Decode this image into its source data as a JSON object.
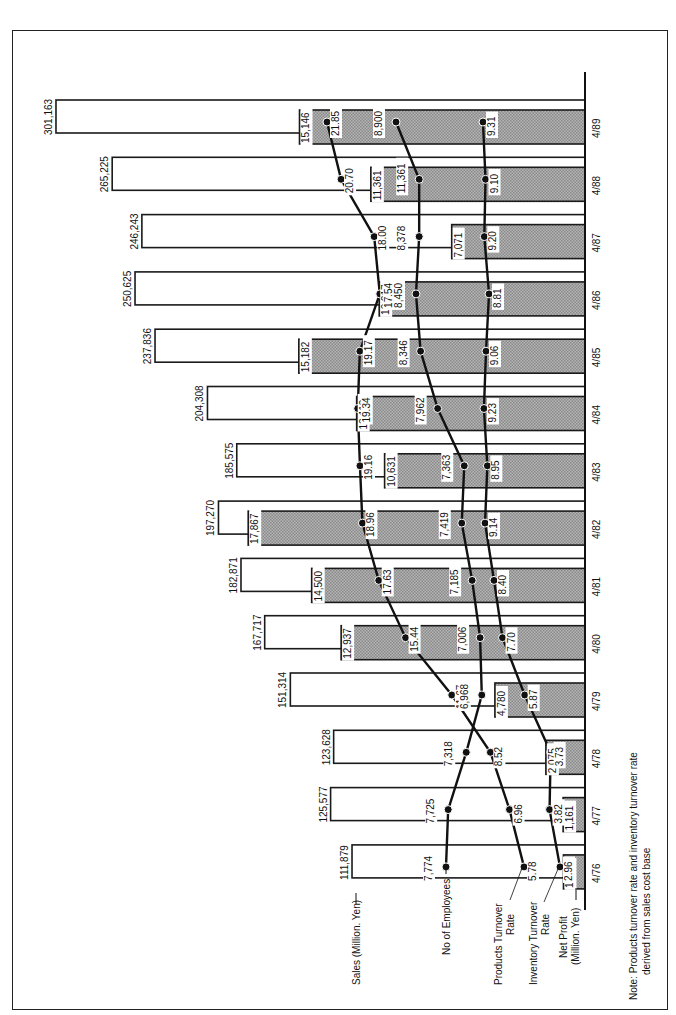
{
  "chart_data": {
    "type": "bar+line",
    "orientation": "rotated (categories top-to-bottom, values extend leftward)",
    "title": "",
    "categories": [
      "4/89",
      "4/88",
      "4/87",
      "4/86",
      "4/85",
      "4/84",
      "4/83",
      "4/82",
      "4/81",
      "4/80",
      "4/79",
      "4/78",
      "4/77",
      "4/76"
    ],
    "series": [
      {
        "name": "Sales (Million. Yen)",
        "kind": "bar-outline",
        "values": [
          301163,
          265225,
          246243,
          250625,
          237836,
          204308,
          185575,
          197270,
          182871,
          167717,
          151314,
          123628,
          125577,
          111879
        ]
      },
      {
        "name": "Net Profit (Million. Yen)",
        "kind": "bar-shaded",
        "values": [
          15146,
          11361,
          7071,
          10917,
          15182,
          12113,
          10631,
          17867,
          14500,
          12937,
          4780,
          2075,
          1161,
          1142
        ]
      },
      {
        "name": "No of Employees",
        "kind": "line",
        "values": [
          8900,
          8378,
          8378,
          8450,
          8346,
          7962,
          7363,
          7419,
          7185,
          7006,
          6968,
          7318,
          7725,
          7774
        ]
      },
      {
        "name": "Products Turnover Rate",
        "kind": "line",
        "values": [
          21.85,
          20.7,
          18.0,
          17.54,
          19.17,
          19.34,
          19.16,
          18.96,
          17.63,
          15.44,
          11.67,
          8.52,
          6.96,
          5.78
        ]
      },
      {
        "name": "Inventory Turnover Rate",
        "kind": "line",
        "values": [
          9.31,
          9.1,
          9.2,
          8.81,
          9.06,
          9.23,
          8.95,
          9.14,
          8.4,
          7.7,
          5.87,
          3.73,
          3.82,
          2.96
        ]
      }
    ],
    "labels": {
      "employees_4_88": "11,361",
      "note": "Note: Products turnover rate and inventory turnover rate derived from sales cost base"
    },
    "colors": {
      "outline": "#1a1a1a",
      "profit_fill": "#9a9a9a",
      "background": "#ffffff"
    }
  },
  "legend": {
    "sales": "Sales (Million. Yen)",
    "employees": "No of Employees",
    "products_1": "Products Turnover",
    "products_2": "Rate",
    "inventory_1": "Inventory Turnover",
    "inventory_2": "Rate",
    "profit_1": "Net Profit",
    "profit_2": "(Million. Yen)"
  },
  "note": {
    "line1": "Note: Products turnover rate and inventory turnover rate",
    "line2": "derived from sales cost base"
  },
  "value_labels": {
    "sales": [
      "301,163",
      "265,225",
      "246,243",
      "250,625",
      "237,836",
      "204,308",
      "185,575",
      "197,270",
      "182,871",
      "167,717",
      "151,314",
      "123,628",
      "125,577",
      "111,879"
    ],
    "profit": [
      "15,146",
      "11,361",
      "7,071",
      "10,917",
      "15,182",
      "12,113",
      "10,631",
      "17,867",
      "14,500",
      "12,937",
      "4,780",
      "2,075",
      "1,161",
      "1,142"
    ],
    "employees": [
      "8,900",
      "11,361",
      "8,378",
      "8,450",
      "8,346",
      "7,962",
      "7,363",
      "7,419",
      "7,185",
      "7,006",
      "6,968",
      "7,318",
      "7,725",
      "7,774"
    ],
    "products": [
      "21.85",
      "20.70",
      "18.00",
      "17.54",
      "19.17",
      "19.34",
      "19.16",
      "18.96",
      "17.63",
      "15.44",
      "11.67",
      "8.52",
      "6.96",
      "5.78"
    ],
    "inventory": [
      "9.31",
      "9.10",
      "9.20",
      "8.81",
      "9.06",
      "9.23",
      "8.95",
      "9.14",
      "8.40",
      "7.70",
      "5.87",
      "3.73",
      "3.82",
      "2.96"
    ]
  }
}
